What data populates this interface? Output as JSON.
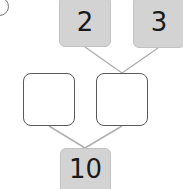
{
  "problem_label": "",
  "top_left": {
    "value": "2"
  },
  "top_right": {
    "value": "3"
  },
  "middle_left": {
    "value": ""
  },
  "middle_right": {
    "value": ""
  },
  "bottom": {
    "value": "10"
  },
  "colors": {
    "filled_box": "#d3d3d3",
    "empty_border": "#5a5a5a",
    "line": "#b0b0b0"
  }
}
